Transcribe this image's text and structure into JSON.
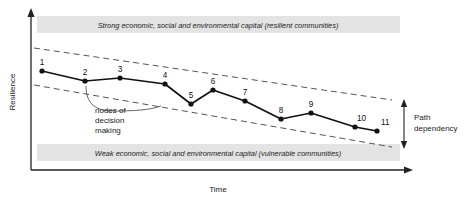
{
  "figure": {
    "title": "",
    "axes": {
      "y_label": "Resilience",
      "x_label": "Time"
    },
    "bands": {
      "top": "Strong economic, social and environmental capital (resilient communities)",
      "bottom": "Weak economic, social and environmental capital (vulnerable communities)",
      "fill": "#e3e3e3"
    },
    "annotations": {
      "nodes_note": [
        "nodes of",
        "decision",
        "making"
      ],
      "path_dependency": [
        "Path",
        "dependency"
      ]
    },
    "colors": {
      "line": "#111111",
      "node": "#111111",
      "envelope": "#555555",
      "axis": "#222222"
    }
  },
  "chart_data": {
    "type": "line",
    "xlabel": "Time",
    "ylabel": "Resilience",
    "grid": false,
    "legend": "none",
    "point_labels": [
      "1",
      "2",
      "3",
      "4",
      "5",
      "6",
      "7",
      "8",
      "9",
      "10",
      "11"
    ],
    "x": [
      42,
      85,
      120,
      165,
      191,
      213,
      245,
      281,
      311,
      355,
      377
    ],
    "y": [
      71,
      81,
      78,
      84,
      104,
      90,
      101,
      119,
      113,
      127,
      131
    ],
    "xlim": [
      30,
      412
    ],
    "ylim": [
      170,
      14
    ],
    "series": [
      {
        "name": "Community resilience trajectory",
        "values": [
          71,
          81,
          78,
          84,
          104,
          90,
          101,
          119,
          113,
          127,
          131
        ]
      }
    ],
    "envelope": {
      "name": "Path dependency envelope",
      "style": "dashed",
      "upper": {
        "x1": 34,
        "y1": 48,
        "x2": 392,
        "y2": 100
      },
      "lower": {
        "x1": 34,
        "y1": 85,
        "x2": 392,
        "y2": 147
      }
    }
  }
}
